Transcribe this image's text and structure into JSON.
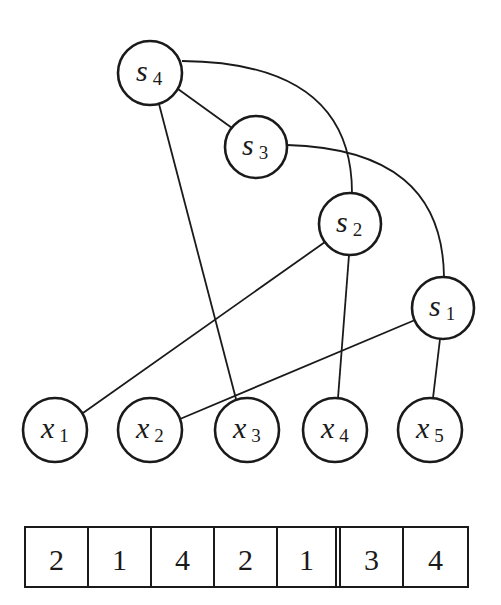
{
  "diagram": {
    "nodes": [
      {
        "id": "s4",
        "base": "s",
        "sub": "4",
        "cx": 150,
        "cy": 73,
        "r": 32
      },
      {
        "id": "s3",
        "base": "s",
        "sub": "3",
        "cx": 256,
        "cy": 147,
        "r": 31
      },
      {
        "id": "s2",
        "base": "s",
        "sub": "2",
        "cx": 350,
        "cy": 224,
        "r": 31
      },
      {
        "id": "s1",
        "base": "s",
        "sub": "1",
        "cx": 443,
        "cy": 308,
        "r": 31
      },
      {
        "id": "x1",
        "base": "x",
        "sub": "1",
        "cx": 55,
        "cy": 430,
        "r": 32
      },
      {
        "id": "x2",
        "base": "x",
        "sub": "2",
        "cx": 150,
        "cy": 430,
        "r": 32
      },
      {
        "id": "x3",
        "base": "x",
        "sub": "3",
        "cx": 247,
        "cy": 430,
        "r": 32
      },
      {
        "id": "x4",
        "base": "x",
        "sub": "4",
        "cx": 335,
        "cy": 430,
        "r": 32
      },
      {
        "id": "x5",
        "base": "x",
        "sub": "5",
        "cx": 430,
        "cy": 430,
        "r": 32
      }
    ],
    "edges": [
      {
        "from": "s4",
        "to": "s3"
      },
      {
        "from": "s4",
        "to": "x3"
      },
      {
        "from": "s4",
        "to": "s2",
        "curved": true
      },
      {
        "from": "s3",
        "to": "s1",
        "curved": true
      },
      {
        "from": "s2",
        "to": "x1"
      },
      {
        "from": "s2",
        "to": "x4"
      },
      {
        "from": "s1",
        "to": "x2"
      },
      {
        "from": "s1",
        "to": "x5"
      }
    ]
  },
  "array": {
    "cells": [
      "2",
      "1",
      "4",
      "2",
      "1",
      "3",
      "4"
    ],
    "separator_after_index": 4
  }
}
